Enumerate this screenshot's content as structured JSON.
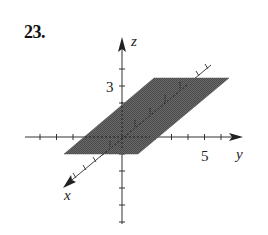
{
  "problem": {
    "number": "23."
  },
  "figure": {
    "type": "3d-coordinate-plot",
    "axes": {
      "x": {
        "label": "x"
      },
      "y": {
        "label": "y",
        "tick_label": "5"
      },
      "z": {
        "label": "z",
        "tick_label": "3"
      }
    },
    "plane": {
      "description": "shaded plane z = y - something, parallel to x-axis",
      "fill_color": "#5e5e5e"
    },
    "colors": {
      "axis": "#333333",
      "plane": "#5e5e5e"
    }
  }
}
